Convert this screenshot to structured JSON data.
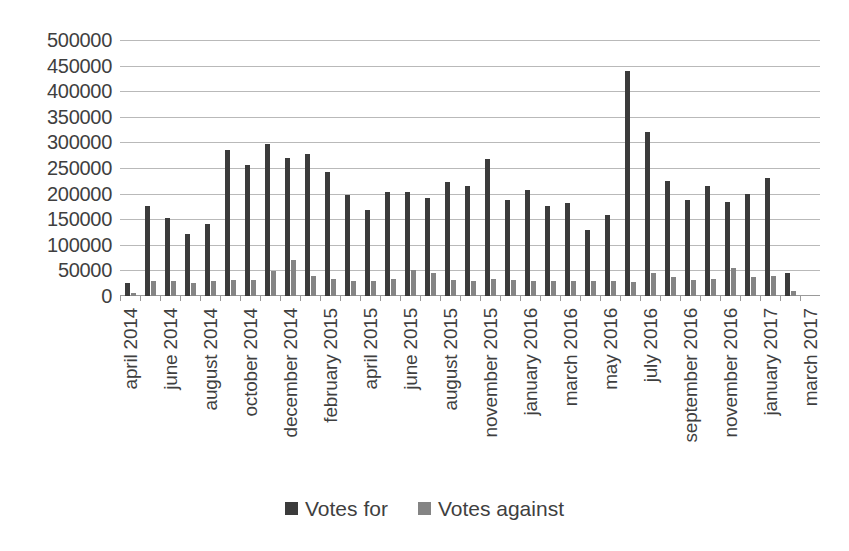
{
  "chart_data": {
    "type": "bar",
    "title": "",
    "xlabel": "",
    "ylabel": "",
    "ylim": [
      0,
      500000
    ],
    "ytick_step": 50000,
    "grid": true,
    "legend_position": "bottom",
    "yticks": [
      "500000",
      "450000",
      "400000",
      "350000",
      "300000",
      "250000",
      "200000",
      "150000",
      "100000",
      "50000",
      "0"
    ],
    "categories": [
      "april 2014",
      "may 2014",
      "june 2014",
      "july 2014",
      "august 2014",
      "september 2014",
      "october 2014",
      "november 2014",
      "december 2014",
      "january 2015",
      "february 2015",
      "march 2015",
      "april 2015",
      "may 2015",
      "june 2015",
      "july 2015",
      "august 2015",
      "september 2015",
      "november 2015",
      "december 2015",
      "january 2016",
      "february 2016",
      "march 2016",
      "april 2016",
      "may 2016",
      "june 2016",
      "july 2016",
      "august 2016",
      "september 2016",
      "october 2016",
      "november 2016",
      "december 2016",
      "january 2017",
      "february 2017",
      "march 2017"
    ],
    "visible_tick_labels": [
      "april 2014",
      "",
      "june 2014",
      "",
      "august 2014",
      "",
      "october 2014",
      "",
      "december 2014",
      "",
      "february 2015",
      "",
      "april 2015",
      "",
      "june 2015",
      "",
      "august 2015",
      "",
      "november 2015",
      "",
      "january 2016",
      "",
      "march 2016",
      "",
      "may 2016",
      "",
      "july 2016",
      "",
      "september 2016",
      "",
      "november 2016",
      "",
      "january 2017",
      "",
      "march 2017"
    ],
    "series": [
      {
        "name": "Votes for",
        "color": "#3b3b3b",
        "values": [
          25000,
          175000,
          152000,
          122000,
          140000,
          285000,
          255000,
          297000,
          270000,
          277000,
          243000,
          197000,
          168000,
          203000,
          203000,
          192000,
          222000,
          215000,
          268000,
          187000,
          207000,
          176000,
          181000,
          128000,
          159000,
          440000,
          320000,
          224000,
          188000,
          215000,
          184000,
          200000,
          231000,
          45000,
          0
        ]
      },
      {
        "name": "Votes against",
        "color": "#848484",
        "values": [
          5000,
          29000,
          30000,
          25000,
          30000,
          32000,
          32000,
          48000,
          70000,
          40000,
          33000,
          30000,
          30000,
          33000,
          50000,
          45000,
          32000,
          30000,
          33000,
          32000,
          30000,
          30000,
          30000,
          30000,
          30000,
          28000,
          45000,
          38000,
          32000,
          33000,
          55000,
          38000,
          40000,
          10000,
          0
        ]
      }
    ]
  },
  "legend": {
    "items": [
      {
        "label": "Votes for",
        "color": "#3b3b3b"
      },
      {
        "label": "Votes against",
        "color": "#848484"
      }
    ]
  }
}
